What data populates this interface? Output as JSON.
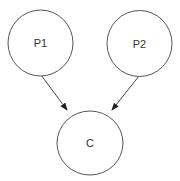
{
  "diagram": {
    "type": "directed-graph",
    "nodes": [
      {
        "id": "P1",
        "label": "P1",
        "cx": 40.5,
        "cy": 43,
        "rx": 32.5,
        "ry": 33
      },
      {
        "id": "P2",
        "label": "P2",
        "cx": 139.5,
        "cy": 43.5,
        "rx": 32.5,
        "ry": 33
      },
      {
        "id": "C",
        "label": "C",
        "cx": 90,
        "cy": 143,
        "rx": 33,
        "ry": 32
      }
    ],
    "edges": [
      {
        "from": "P1",
        "to": "C"
      },
      {
        "from": "P2",
        "to": "C"
      }
    ],
    "colors": {
      "stroke": "#555555",
      "text": "#333333",
      "background": "#ffffff"
    }
  }
}
